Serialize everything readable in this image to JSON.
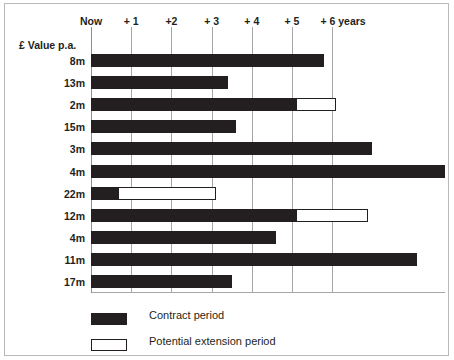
{
  "chart_data": {
    "type": "bar",
    "orientation": "horizontal",
    "title": "",
    "subtitle": "",
    "xlabel": "",
    "ylabel": "£ Value p.a.",
    "xlim": [
      0,
      8.8
    ],
    "ylim": null,
    "grid": true,
    "legend_position": "bottom-left",
    "x_tick_labels": [
      "Now",
      "+ 1",
      "+2",
      "+ 3",
      "+ 4",
      "+ 5",
      "+ 6 years"
    ],
    "x_tick_values": [
      0,
      1,
      2,
      3,
      4,
      5,
      6
    ],
    "categories": [
      "8m",
      "13m",
      "2m",
      "15m",
      "3m",
      "4m",
      "22m",
      "12m",
      "4m",
      "11m",
      "17m"
    ],
    "series": [
      {
        "name": "Contract period",
        "color": "#231f20",
        "style": "filled",
        "values": [
          5.8,
          3.4,
          5.1,
          3.6,
          7.0,
          8.8,
          0.67,
          5.1,
          4.6,
          8.1,
          3.5
        ]
      },
      {
        "name": "Potential extension period",
        "color": "#ffffff",
        "style": "outlined",
        "starts": [
          null,
          null,
          5.1,
          null,
          null,
          null,
          0.67,
          5.1,
          null,
          null,
          null
        ],
        "ends": [
          null,
          null,
          6.1,
          null,
          null,
          null,
          3.1,
          6.9,
          null,
          null,
          null
        ]
      }
    ],
    "legend": [
      {
        "label": "Contract period",
        "swatch": "filled"
      },
      {
        "label": "Potential extension period",
        "swatch": "outlined"
      }
    ]
  },
  "axis": {
    "y_caption": "£ Value p.a.",
    "ticks": [
      {
        "label": "Now",
        "value": 0
      },
      {
        "label": "+ 1",
        "value": 1
      },
      {
        "label": "+2",
        "value": 2
      },
      {
        "label": "+ 3",
        "value": 3
      },
      {
        "label": "+ 4",
        "value": 4
      },
      {
        "label": "+ 5",
        "value": 5
      },
      {
        "label": "+ 6 years",
        "value": 6
      }
    ]
  },
  "rows": [
    {
      "label": "8m",
      "contract_end": 5.8
    },
    {
      "label": "13m",
      "contract_end": 3.4
    },
    {
      "label": "2m",
      "contract_end": 5.1,
      "extension_end": 6.1
    },
    {
      "label": "15m",
      "contract_end": 3.6
    },
    {
      "label": "3m",
      "contract_end": 7.0
    },
    {
      "label": "4m",
      "contract_end": 8.8
    },
    {
      "label": "22m",
      "contract_end": 0.67,
      "extension_end": 3.1
    },
    {
      "label": "12m",
      "contract_end": 5.1,
      "extension_end": 6.9
    },
    {
      "label": "4m",
      "contract_end": 4.6
    },
    {
      "label": "11m",
      "contract_end": 8.1
    },
    {
      "label": "17m",
      "contract_end": 3.5
    }
  ],
  "legend": {
    "contract_label": "Contract period",
    "extension_label": "Potential extension period"
  },
  "colors": {
    "contract": "#231f20",
    "extension_fill": "#ffffff",
    "extension_stroke": "#231f20",
    "gridline": "#a6a6a6",
    "frame": "#b9b9b9",
    "text": "#231f20"
  }
}
